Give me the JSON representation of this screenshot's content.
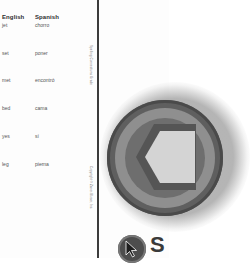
{
  "word_table": {
    "headers": {
      "english": "English",
      "spanish": "Spanish"
    },
    "rows": [
      {
        "english": "jet",
        "spanish": "chorro"
      },
      {
        "english": "set",
        "spanish": "poner"
      },
      {
        "english": "met",
        "spanish": "encontró"
      },
      {
        "english": "bed",
        "spanish": "cama"
      },
      {
        "english": "yes",
        "spanish": "sí"
      },
      {
        "english": "leg",
        "spanish": "pierna"
      }
    ]
  },
  "side_text": {
    "top": "Spelling Connections Grade",
    "bottom": "Copyright © Zaner-Bloser, Inc."
  },
  "graphic": {
    "badge_icon": "hexagon-badge-icon",
    "cursor_icon": "cursor-arrow-icon",
    "cursor_label_partial": "S"
  },
  "colors": {
    "rule": "#3c3c3c",
    "text": "#555555",
    "badge_dark": "#5f5f5f",
    "badge_light": "#d4d4d4"
  }
}
